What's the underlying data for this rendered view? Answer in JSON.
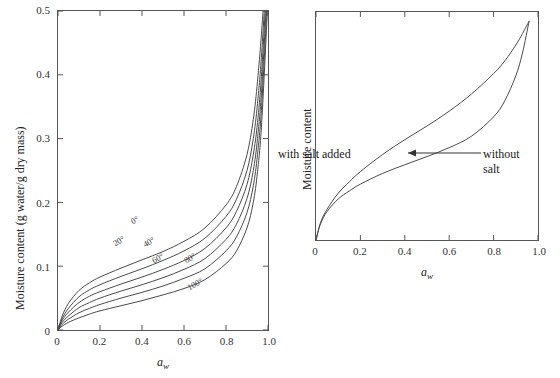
{
  "figure": {
    "background_color": "#ffffff",
    "line_color": "#4a4a4a",
    "frame_color": "#555555"
  },
  "chart_data": [
    {
      "type": "line",
      "panel": "left",
      "title": "",
      "xlabel": "a_w",
      "ylabel": "Moisture content (g water/g dry mass)",
      "xlim": [
        0,
        1.0
      ],
      "ylim": [
        0,
        0.5
      ],
      "grid": false,
      "legend_position": "inline-curve-labels",
      "xticks": [
        0,
        0.2,
        0.4,
        0.6,
        0.8,
        1.0
      ],
      "xticklabels": [
        "0",
        "0.2",
        "0.4",
        "0.6",
        "0.8",
        "1.0"
      ],
      "yticks": [
        0,
        0.1,
        0.2,
        0.3,
        0.4,
        0.5
      ],
      "yticklabels": [
        "0",
        "0.1",
        "0.2",
        "0.3",
        "0.4",
        "0.5"
      ],
      "x": [
        0,
        0.02,
        0.05,
        0.1,
        0.15,
        0.2,
        0.3,
        0.4,
        0.5,
        0.6,
        0.7,
        0.8,
        0.85,
        0.9,
        0.93,
        0.95,
        0.97,
        1.0
      ],
      "series": [
        {
          "name": "0°",
          "label": "0°",
          "temperature_c": 0,
          "values": [
            0,
            0.022,
            0.042,
            0.062,
            0.074,
            0.083,
            0.097,
            0.11,
            0.123,
            0.139,
            0.16,
            0.196,
            0.225,
            0.275,
            0.33,
            0.39,
            0.47,
            0.62
          ]
        },
        {
          "name": "20°",
          "label": "20°",
          "temperature_c": 20,
          "values": [
            0,
            0.018,
            0.034,
            0.052,
            0.063,
            0.071,
            0.084,
            0.096,
            0.109,
            0.124,
            0.144,
            0.178,
            0.205,
            0.25,
            0.3,
            0.355,
            0.435,
            0.6
          ]
        },
        {
          "name": "40°",
          "label": "40°",
          "temperature_c": 40,
          "values": [
            0,
            0.015,
            0.028,
            0.043,
            0.053,
            0.06,
            0.072,
            0.083,
            0.095,
            0.109,
            0.128,
            0.16,
            0.186,
            0.228,
            0.275,
            0.325,
            0.405,
            0.58
          ]
        },
        {
          "name": "60°",
          "label": "60°",
          "temperature_c": 60,
          "values": [
            0,
            0.012,
            0.022,
            0.035,
            0.043,
            0.05,
            0.061,
            0.071,
            0.082,
            0.095,
            0.112,
            0.142,
            0.166,
            0.206,
            0.25,
            0.3,
            0.378,
            0.56
          ]
        },
        {
          "name": "80°",
          "label": "80°",
          "temperature_c": 80,
          "values": [
            0,
            0.009,
            0.017,
            0.027,
            0.034,
            0.04,
            0.05,
            0.059,
            0.069,
            0.081,
            0.096,
            0.124,
            0.146,
            0.184,
            0.226,
            0.275,
            0.352,
            0.54
          ]
        },
        {
          "name": "100°",
          "label": "100°",
          "temperature_c": 100,
          "values": [
            0,
            0.006,
            0.012,
            0.019,
            0.025,
            0.03,
            0.038,
            0.046,
            0.055,
            0.065,
            0.079,
            0.104,
            0.124,
            0.16,
            0.2,
            0.248,
            0.325,
            0.52
          ]
        }
      ]
    },
    {
      "type": "line",
      "panel": "right",
      "title": "",
      "xlabel": "a_w",
      "ylabel": "Moisture content",
      "xlim": [
        0,
        1.0
      ],
      "ylim": [
        0,
        1.0
      ],
      "grid": false,
      "legend_position": "inline-annotations",
      "xticks": [
        0,
        0.2,
        0.4,
        0.6,
        0.8,
        1.0
      ],
      "xticklabels": [
        "0",
        "0.2",
        "0.4",
        "0.6",
        "0.8",
        "1.0"
      ],
      "yticks": [],
      "yticklabels": [],
      "x": [
        0,
        0.02,
        0.05,
        0.1,
        0.15,
        0.2,
        0.3,
        0.4,
        0.5,
        0.6,
        0.7,
        0.8,
        0.85,
        0.9,
        0.93,
        0.96
      ],
      "series": [
        {
          "name": "with salt added",
          "label": "with salt added",
          "values": [
            0,
            0.075,
            0.135,
            0.205,
            0.255,
            0.3,
            0.375,
            0.44,
            0.5,
            0.565,
            0.64,
            0.73,
            0.785,
            0.855,
            0.905,
            0.96
          ]
        },
        {
          "name": "without salt",
          "label": "without salt",
          "values": [
            0,
            0.07,
            0.125,
            0.18,
            0.215,
            0.245,
            0.292,
            0.33,
            0.366,
            0.405,
            0.455,
            0.54,
            0.61,
            0.72,
            0.82,
            0.96
          ]
        }
      ],
      "annotations": [
        {
          "text": "with salt added",
          "at_x": 0.38,
          "at_y": 0.52,
          "arrow": false
        },
        {
          "text_line1": "without",
          "text_line2": "salt",
          "at_x": 0.8,
          "at_y": 0.52,
          "arrow": true,
          "arrow_direction": "left",
          "arrow_from_x": 0.78,
          "arrow_to_x": 0.6,
          "arrow_y": 0.52
        }
      ]
    }
  ]
}
